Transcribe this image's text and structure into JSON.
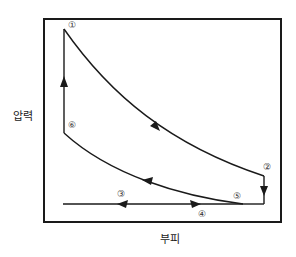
{
  "diagram": {
    "type": "pressure-volume cycle",
    "y_axis_label": "압력",
    "x_axis_label": "부피",
    "points": [
      {
        "id": "1",
        "label": "①"
      },
      {
        "id": "2",
        "label": "②"
      },
      {
        "id": "3",
        "label": "③"
      },
      {
        "id": "4",
        "label": "④"
      },
      {
        "id": "5",
        "label": "⑤"
      },
      {
        "id": "6",
        "label": "⑥"
      }
    ],
    "colors": {
      "line": "#1a1a1a",
      "frame": "#1a1a1a",
      "label": "#333333"
    }
  }
}
